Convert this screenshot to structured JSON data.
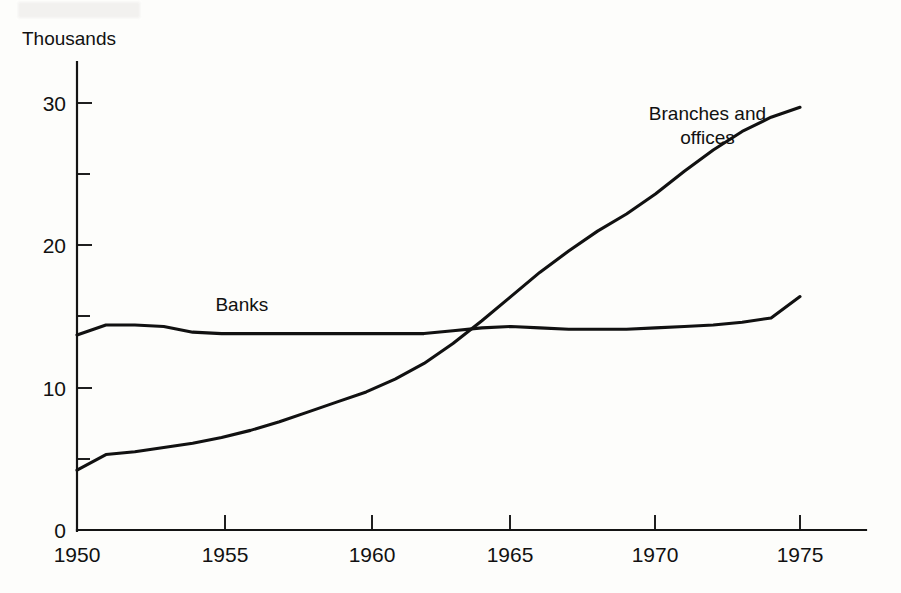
{
  "figure": {
    "unit_label": "Thousands",
    "background_color": "#fdfdfb",
    "ink_color": "#111111"
  },
  "chart_data": {
    "type": "line",
    "title": "",
    "subtitle": "",
    "xlabel": "",
    "ylabel": "Thousands",
    "xlim": [
      1950,
      1977
    ],
    "ylim": [
      0,
      32
    ],
    "grid": false,
    "legend": "inline-annotations",
    "x_ticks": [
      1950,
      1955,
      1960,
      1965,
      1970,
      1975
    ],
    "x_tick_labels": [
      "1950",
      "1955",
      "1960",
      "1965",
      "1970",
      "1975"
    ],
    "y_ticks": [
      0,
      10,
      20,
      30
    ],
    "y_tick_labels": [
      "0",
      "10",
      "20",
      "30"
    ],
    "y_minor_ticks": [
      5,
      15,
      25
    ],
    "annotations": [
      {
        "text": "Banks",
        "x": 1955.7,
        "y": 15.4
      },
      {
        "text": "Branches and",
        "x": 1971.8,
        "y": 28.8
      },
      {
        "text": "offices",
        "x": 1971.8,
        "y": 27.1
      }
    ],
    "series": [
      {
        "name": "Banks",
        "color": "#111111",
        "x": [
          1950,
          1951,
          1952,
          1953,
          1954,
          1955,
          1956,
          1957,
          1958,
          1959,
          1960,
          1961,
          1962,
          1963,
          1964,
          1965,
          1966,
          1967,
          1968,
          1969,
          1970,
          1971,
          1972,
          1973,
          1974,
          1975
        ],
        "values": [
          13.7,
          14.4,
          14.4,
          14.3,
          13.9,
          13.8,
          13.8,
          13.8,
          13.8,
          13.8,
          13.8,
          13.8,
          13.8,
          14.0,
          14.2,
          14.3,
          14.2,
          14.1,
          14.1,
          14.1,
          14.2,
          14.3,
          14.4,
          14.6,
          14.9,
          16.4
        ]
      },
      {
        "name": "Branches and offices",
        "color": "#111111",
        "x": [
          1950,
          1951,
          1952,
          1953,
          1954,
          1955,
          1956,
          1957,
          1958,
          1959,
          1960,
          1961,
          1962,
          1963,
          1964,
          1965,
          1966,
          1967,
          1968,
          1969,
          1970,
          1971,
          1972,
          1973,
          1974,
          1975
        ],
        "values": [
          4.2,
          5.3,
          5.5,
          5.8,
          6.1,
          6.5,
          7.0,
          7.6,
          8.3,
          9.0,
          9.7,
          10.6,
          11.7,
          13.1,
          14.7,
          16.4,
          18.1,
          19.6,
          21.0,
          22.2,
          23.6,
          25.2,
          26.7,
          28.0,
          29.0,
          29.7
        ]
      }
    ],
    "crossing_point": {
      "x": 1963.5,
      "y": 13.95
    }
  },
  "geometry": {
    "x_axis_y_px": 530,
    "y_axis_x_px": 77,
    "x_px_1950": 77,
    "x_px_1975": 800,
    "x_axis_right_end_px": 865,
    "y_px_zero": 530,
    "y_px_thirty": 103,
    "y_axis_top_px": 62
  }
}
